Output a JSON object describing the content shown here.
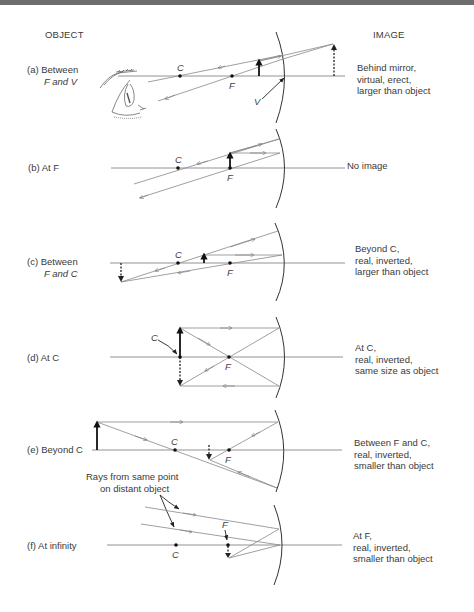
{
  "headers": {
    "object": "OBJECT",
    "image": "IMAGE"
  },
  "cases": [
    {
      "id": "a",
      "object_label": [
        "(a) Between",
        "F and V"
      ],
      "image_label": [
        "Behind mirror,",
        "virtual, erect,",
        "larger than object"
      ],
      "points": {
        "C": "C",
        "F": "F",
        "V": "V"
      },
      "axis_y": 76
    },
    {
      "id": "b",
      "object_label": [
        "(b) At F"
      ],
      "image_label": [
        "No image"
      ],
      "points": {
        "C": "C",
        "F": "F"
      },
      "axis_y": 168
    },
    {
      "id": "c",
      "object_label": [
        "(c) Between",
        "F and C"
      ],
      "image_label": [
        "Beyond C,",
        "real, inverted,",
        "larger than object"
      ],
      "points": {
        "C": "C",
        "F": "F"
      },
      "axis_y": 263
    },
    {
      "id": "d",
      "object_label": [
        "(d) At C"
      ],
      "image_label": [
        "At C,",
        "real, inverted,",
        "same size as object"
      ],
      "points": {
        "C": "C",
        "F": "F"
      },
      "axis_y": 357
    },
    {
      "id": "e",
      "object_label": [
        "(e) Beyond C"
      ],
      "image_label": [
        "Between F and C,",
        "real, inverted,",
        "smaller than object"
      ],
      "points": {
        "C": "C",
        "F": "F"
      },
      "axis_y": 450
    },
    {
      "id": "f",
      "object_label": [
        "(f) At infinity"
      ],
      "image_label": [
        "At F,",
        "real, inverted,",
        "smaller than object"
      ],
      "points": {
        "C": "C",
        "F": "F"
      },
      "annotation": [
        "Rays from same point",
        "on distant object"
      ],
      "axis_y": 545
    }
  ],
  "colors": {
    "ink": "#111111",
    "ray": "#888888",
    "axis": "#777777",
    "text": "#3a3a3a",
    "topbar": "#6e6e6e"
  }
}
